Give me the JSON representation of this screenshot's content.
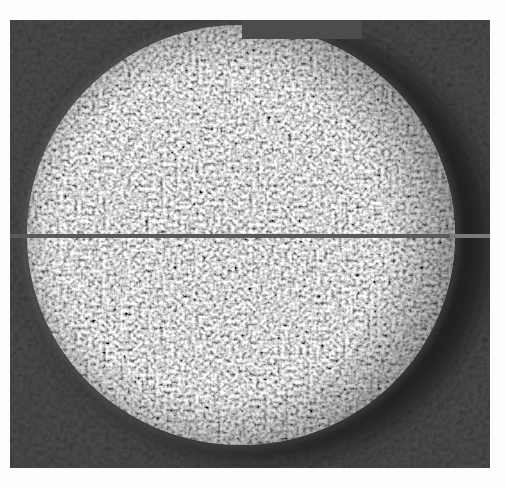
{
  "image": {
    "kind": "grayscale scanned photograph",
    "subject": "speckled bright circular disc with dark halo and a thin horizontal line across its diameter",
    "colors": {
      "page": "#fdfdfd",
      "background": "#4a4a4a",
      "disc": "#d8d8d8",
      "halo": "#1e1e1e",
      "line": "#5a5a5a"
    }
  },
  "bleed_through": {
    "top": "",
    "bottom": ""
  }
}
